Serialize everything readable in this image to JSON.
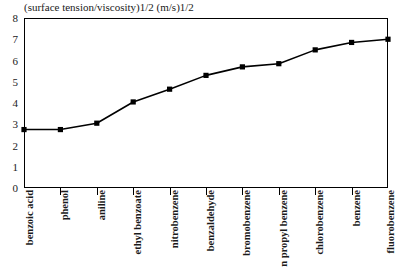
{
  "chart_data": {
    "type": "line",
    "title": "(surface tension/viscosity)1/2 (m/s)1/2",
    "xlabel": "",
    "ylabel": "",
    "ylim": [
      0,
      8
    ],
    "ytick_labels": [
      "0",
      "1",
      "2",
      "3",
      "4",
      "5",
      "6",
      "7",
      "8"
    ],
    "yticks": [
      0,
      1,
      2,
      3,
      4,
      5,
      6,
      7,
      8
    ],
    "grid": false,
    "legend": "none",
    "marker": "filled-square",
    "line_color": "#000000",
    "categories": [
      "benzoic acid",
      "phenol",
      "aniline",
      "ethyl benzoate",
      "nitrobenzene",
      "benzaldehyde",
      "bromobenzene",
      "n propyl benzene",
      "chlorobenzene",
      "benzene",
      "fluorobenzene"
    ],
    "values": [
      2.75,
      2.75,
      3.05,
      4.05,
      4.65,
      5.3,
      5.7,
      5.85,
      6.5,
      6.85,
      7.0
    ],
    "series": [
      {
        "name": "(surface tension/viscosity)1/2",
        "values": [
          2.75,
          2.75,
          3.05,
          4.05,
          4.65,
          5.3,
          5.7,
          5.85,
          6.5,
          6.85,
          7.0
        ]
      }
    ]
  }
}
